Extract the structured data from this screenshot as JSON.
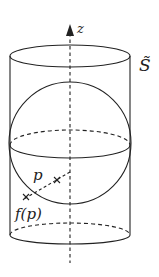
{
  "diagram": {
    "labels": {
      "axis": "z",
      "surface": "S̃",
      "point": "p",
      "image_point": "f(p)"
    },
    "colors": {
      "stroke": "#222222",
      "background": "#ffffff"
    }
  }
}
